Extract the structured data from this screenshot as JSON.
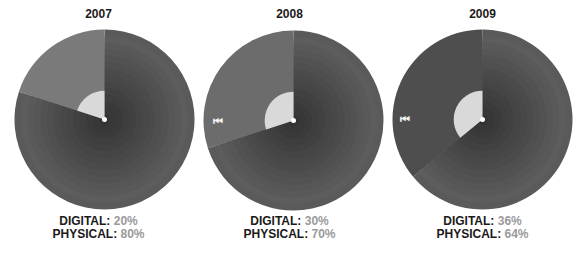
{
  "chart_data": [
    {
      "type": "pie",
      "title": "2007",
      "categories": [
        "DIGITAL",
        "PHYSICAL"
      ],
      "values": [
        20,
        80
      ],
      "labels": [
        "DIGITAL: 20%",
        "PHYSICAL: 80%"
      ],
      "icon": null
    },
    {
      "type": "pie",
      "title": "2008",
      "categories": [
        "DIGITAL",
        "PHYSICAL"
      ],
      "values": [
        30,
        70
      ],
      "labels": [
        "DIGITAL: 30%",
        "PHYSICAL: 70%"
      ],
      "icon": "rewind-icon"
    },
    {
      "type": "pie",
      "title": "2009",
      "categories": [
        "DIGITAL",
        "PHYSICAL"
      ],
      "values": [
        36,
        64
      ],
      "labels": [
        "DIGITAL: 36%",
        "PHYSICAL: 64%"
      ],
      "icon": "rewind-icon"
    }
  ],
  "panels": [
    {
      "year": "2007",
      "digital_label": "DIGITAL:",
      "digital_pct": "20%",
      "physical_label": "PHYSICAL:",
      "physical_pct": "80%"
    },
    {
      "year": "2008",
      "digital_label": "DIGITAL:",
      "digital_pct": "30%",
      "physical_label": "PHYSICAL:",
      "physical_pct": "70%",
      "icon": "⏮"
    },
    {
      "year": "2009",
      "digital_label": "DIGITAL:",
      "digital_pct": "36%",
      "physical_label": "PHYSICAL:",
      "physical_pct": "64%",
      "icon": "⏮"
    }
  ],
  "colors": {
    "physical": "#5a5a5a",
    "physical_ring_dark": "#3a3a3a",
    "digital": "#7a7a7a",
    "digital_2008": "#6c6c6c",
    "digital_2009": "#4e4e4e",
    "center_wedge": "#d9d9d9",
    "pct_text": "#9a9a9a"
  }
}
